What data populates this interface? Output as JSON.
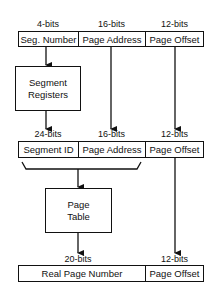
{
  "row1": {
    "fields": [
      {
        "bits": "4-bits",
        "label": "Seg. Number"
      },
      {
        "bits": "16-bits",
        "label": "Page Address"
      },
      {
        "bits": "12-bits",
        "label": "Page Offset"
      }
    ]
  },
  "segment_registers": {
    "line1": "Segment",
    "line2": "Registers"
  },
  "row2": {
    "fields": [
      {
        "bits": "24-bits",
        "label": "Segment ID"
      },
      {
        "bits": "16-bits",
        "label": "Page Address"
      },
      {
        "bits": "12-bits",
        "label": "Page Offset"
      }
    ]
  },
  "page_table": {
    "line1": "Page",
    "line2": "Table"
  },
  "row3": {
    "fields": [
      {
        "bits": "20-bits",
        "label": "Real Page Number"
      },
      {
        "bits": "12-bits",
        "label": "Page Offset"
      }
    ]
  }
}
